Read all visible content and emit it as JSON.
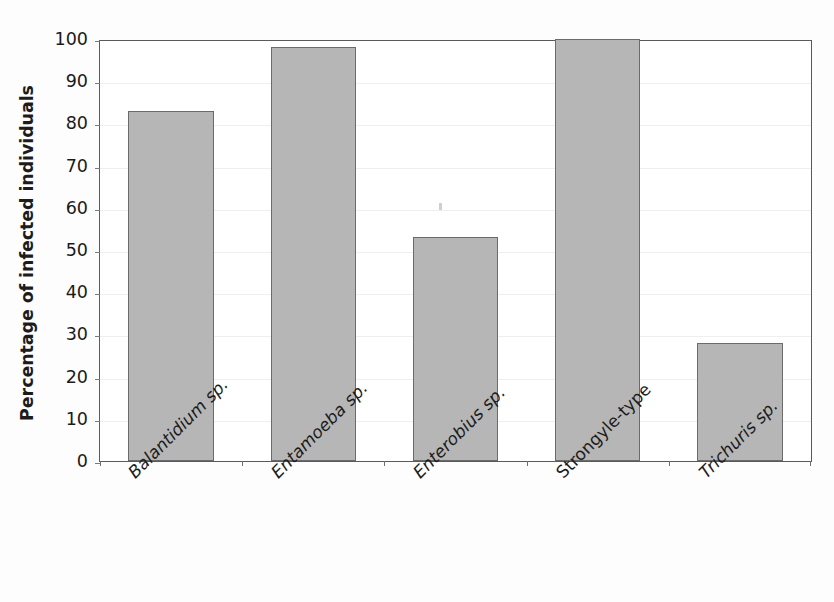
{
  "chart_data": {
    "type": "bar",
    "title": "",
    "xlabel": "",
    "ylabel": "Percentage of infected individuals",
    "categories": [
      "Balantidium sp.",
      "Entamoeba sp.",
      "Enterobius sp.",
      "Strongyle-type",
      "Trichuris sp."
    ],
    "categories_italic": [
      true,
      true,
      true,
      false,
      true
    ],
    "values": [
      83,
      98,
      53,
      100,
      28
    ],
    "ylim": [
      0,
      100
    ],
    "yticks": [
      0,
      10,
      20,
      30,
      40,
      50,
      60,
      70,
      80,
      90,
      100
    ],
    "ytick_labels": [
      "0",
      "10",
      "20",
      "30",
      "40",
      "50",
      "60",
      "70",
      "80",
      "90",
      "100"
    ],
    "grid": true,
    "legend": null,
    "legend_position": "none",
    "series": [
      {
        "name": "Percentage of infected individuals",
        "values": [
          83,
          98,
          53,
          100,
          28
        ]
      }
    ],
    "colors": {
      "bar_fill": "#b6b6b6",
      "bar_border": "#6b6b6b",
      "axis": "#5a5a5a",
      "grid": "#efefef",
      "text": "#1c1c1c",
      "background": "#ffffff"
    }
  }
}
